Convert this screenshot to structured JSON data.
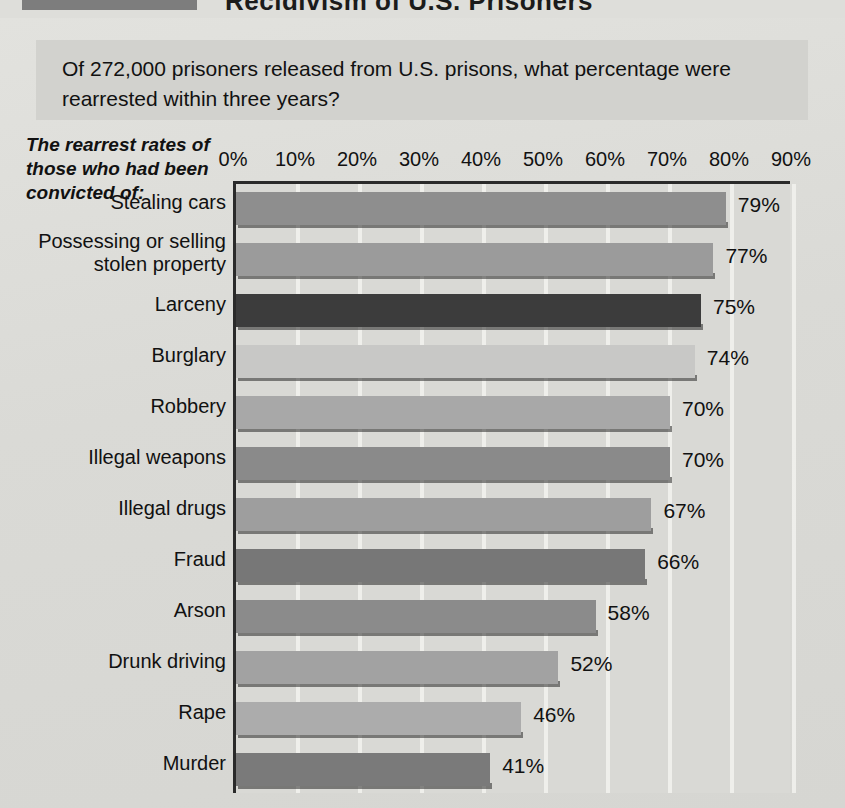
{
  "header": {
    "title": "Recidivism of U.S. Prisoners",
    "swatch_color": "#7d7d7d"
  },
  "question": "Of 272,000 prisoners released from U.S. prisons, what percentage were rearrested within three years?",
  "axis_caption": "The rearrest rates of those who had been convicted of:",
  "chart_data": {
    "type": "bar",
    "orientation": "horizontal",
    "title": "Recidivism of U.S. Prisoners",
    "subtitle": "Of 272,000 prisoners released from U.S. prisons, what percentage were rearrested within three years?",
    "xlabel": "",
    "ylabel": "The rearrest rates of those who had been convicted of:",
    "xlim": [
      0,
      95
    ],
    "grid": true,
    "legend": "none",
    "tick_labels": [
      "0%",
      "10%",
      "20%",
      "30%",
      "40%",
      "50%",
      "60%",
      "70%",
      "80%",
      "90%"
    ],
    "tick_values": [
      0,
      10,
      20,
      30,
      40,
      50,
      60,
      70,
      80,
      90
    ],
    "categories": [
      "Stealing cars",
      "Possessing or selling stolen property",
      "Larceny",
      "Burglary",
      "Robbery",
      "Illegal weapons",
      "Illegal drugs",
      "Fraud",
      "Arson",
      "Drunk driving",
      "Rape",
      "Murder"
    ],
    "values": [
      79,
      77,
      75,
      74,
      70,
      70,
      67,
      66,
      58,
      52,
      46,
      41
    ],
    "value_labels": [
      "79%",
      "77%",
      "75%",
      "74%",
      "70%",
      "70%",
      "67%",
      "66%",
      "58%",
      "52%",
      "46%",
      "41%"
    ],
    "bar_colors": [
      "#8e8e8e",
      "#9b9b9b",
      "#3c3c3c",
      "#c8c8c6",
      "#a8a8a8",
      "#8a8a8a",
      "#9e9e9e",
      "#777777",
      "#8b8b8b",
      "#a2a2a2",
      "#acacac",
      "#7a7a7a"
    ]
  },
  "colors": {
    "paper": "#dcdcd8",
    "plot_background": "#d9d9d5",
    "gridline": "#f2f2ef",
    "axis": "#2a2a2a",
    "text": "#111111"
  }
}
